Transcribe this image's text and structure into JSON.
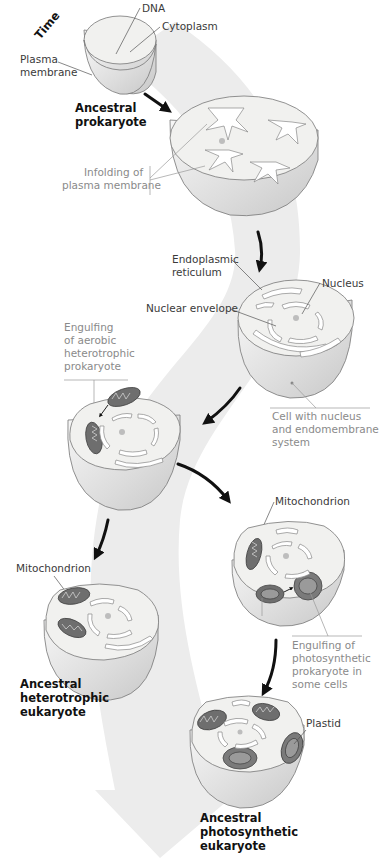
{
  "figure": {
    "timeline_label": "Time",
    "band_color": "#ececec",
    "stages": [
      {
        "id": "ancestral-prokaryote",
        "title_line1": "Ancestral",
        "title_line2": "prokaryote",
        "labels": {
          "dna": "DNA",
          "cytoplasm": "Cytoplasm",
          "plasma_line1": "Plasma",
          "plasma_line2": "membrane"
        }
      },
      {
        "id": "infolding",
        "labels": {
          "infolding_line1": "Infolding of",
          "infolding_line2": "plasma membrane"
        }
      },
      {
        "id": "nucleated-cell",
        "labels": {
          "er_line1": "Endoplasmic",
          "er_line2": "reticulum",
          "nucleus": "Nucleus",
          "nuclear_envelope": "Nuclear envelope",
          "caption_line1": "Cell with nucleus",
          "caption_line2": "and endomembrane",
          "caption_line3": "system"
        }
      },
      {
        "id": "engulfing-aerobic",
        "labels": {
          "line1": "Engulfing",
          "line2": "of aerobic",
          "line3": "heterotrophic",
          "line4": "prokaryote"
        }
      },
      {
        "id": "ancestral-heterotrophic-eukaryote",
        "title_line1": "Ancestral",
        "title_line2": "heterotrophic",
        "title_line3": "eukaryote",
        "labels": {
          "mitochondrion": "Mitochondrion"
        }
      },
      {
        "id": "engulfing-photosynthetic",
        "labels": {
          "mitochondrion": "Mitochondrion",
          "line1": "Engulfing of",
          "line2": "photosynthetic",
          "line3": "prokaryote in",
          "line4": "some cells"
        }
      },
      {
        "id": "ancestral-photosynthetic-eukaryote",
        "title_line1": "Ancestral",
        "title_line2": "photosynthetic",
        "title_line3": "eukaryote",
        "labels": {
          "plastid": "Plastid"
        }
      }
    ]
  }
}
